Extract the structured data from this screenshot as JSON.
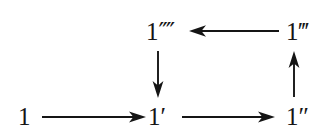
{
  "figure": {
    "type": "commutative-diagram",
    "background_color": "#ffffff",
    "ink_color": "#151515"
  },
  "nodes": [
    {
      "id": "one",
      "label": "1",
      "base": "1",
      "primes": "",
      "prime_count": 0,
      "x": 18,
      "y": 104,
      "row": "bottom",
      "column": "left"
    },
    {
      "id": "one_prime",
      "label": "1′",
      "base": "1",
      "primes": "′",
      "prime_count": 1,
      "x": 148,
      "y": 104,
      "row": "bottom",
      "column": "middle"
    },
    {
      "id": "one_dprime",
      "label": "1″",
      "base": "1",
      "primes": "″",
      "prime_count": 2,
      "x": 286,
      "y": 104,
      "row": "bottom",
      "column": "right"
    },
    {
      "id": "one_tprime",
      "label": "1‴",
      "base": "1",
      "primes": "‴",
      "prime_count": 3,
      "x": 286,
      "y": 19,
      "row": "top",
      "column": "right"
    },
    {
      "id": "one_qprime",
      "label": "1⁗",
      "base": "1",
      "primes": "⁗",
      "prime_count": 4,
      "x": 146,
      "y": 19,
      "row": "top",
      "column": "middle"
    }
  ],
  "edges": [
    {
      "id": "one-to-one-prime",
      "from": "one",
      "to": "one_prime",
      "direction": "right",
      "style": "solid",
      "arrowhead": "filled"
    },
    {
      "id": "one-prime-to-one-dprime",
      "from": "one_prime",
      "to": "one_dprime",
      "direction": "right",
      "style": "solid",
      "arrowhead": "filled"
    },
    {
      "id": "one-dprime-to-one-tprime",
      "from": "one_dprime",
      "to": "one_tprime",
      "direction": "up",
      "style": "solid",
      "arrowhead": "filled"
    },
    {
      "id": "one-tprime-to-one-qprime",
      "from": "one_tprime",
      "to": "one_qprime",
      "direction": "left",
      "style": "solid",
      "arrowhead": "filled"
    },
    {
      "id": "one-qprime-to-one-prime",
      "from": "one_qprime",
      "to": "one_prime",
      "direction": "down",
      "style": "solid",
      "arrowhead": "filled"
    }
  ]
}
